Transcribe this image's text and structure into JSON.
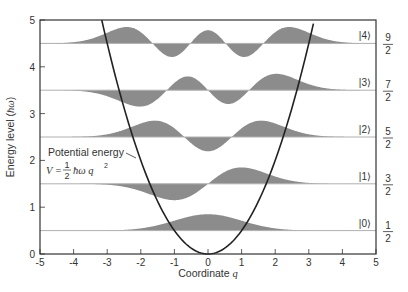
{
  "chart_data": {
    "type": "area",
    "title": "",
    "xlabel": "Coordinate q",
    "ylabel": "Energy level (ħω)",
    "xlim": [
      -5,
      5
    ],
    "ylim": [
      0,
      5
    ],
    "xticks": [
      -5,
      -4,
      -3,
      -2,
      -1,
      0,
      1,
      2,
      3,
      4,
      5
    ],
    "yticks": [
      0,
      1,
      2,
      3,
      4,
      5
    ],
    "grid": false,
    "fill_color": "#8c8c8c",
    "baseline_color": "#b0b0b0",
    "curve_color": "#222222",
    "wavefunction_amplitude": 0.35,
    "series": [
      {
        "name": "|0⟩",
        "n": 0,
        "energy": 0.5,
        "energy_label": "1/2",
        "type": "wavefunction"
      },
      {
        "name": "|1⟩",
        "n": 1,
        "energy": 1.5,
        "energy_label": "3/2",
        "type": "wavefunction"
      },
      {
        "name": "|2⟩",
        "n": 2,
        "energy": 2.5,
        "energy_label": "5/2",
        "type": "wavefunction"
      },
      {
        "name": "|3⟩",
        "n": 3,
        "energy": 3.5,
        "energy_label": "7/2",
        "type": "wavefunction"
      },
      {
        "name": "|4⟩",
        "n": 4,
        "energy": 4.5,
        "energy_label": "9/2",
        "type": "wavefunction"
      },
      {
        "name": "Potential energy",
        "type": "line",
        "formula": "V = 1/2 ħω q^2",
        "x": [
          -3.16,
          -2,
          -1,
          0,
          1,
          2,
          3.16
        ],
        "y": [
          5,
          2,
          0.5,
          0,
          0.5,
          2,
          5
        ]
      }
    ],
    "annotations": [
      {
        "text": "Potential energy",
        "x": -3.5,
        "y": 2.32
      },
      {
        "text": "V = ½ħω q²",
        "x": -3.9,
        "y": 1.95
      }
    ]
  },
  "labels": {
    "ylabel_main": "Energy level (",
    "ylabel_unit": "ħω",
    "ylabel_close": ")",
    "xlabel_main": "Coordinate ",
    "xlabel_var": "q",
    "potential_label": "Potential energy",
    "formula_lhs": "V = ",
    "formula_num": "1",
    "formula_den": "2",
    "formula_rhs": "ħω q",
    "formula_exp": "2"
  }
}
